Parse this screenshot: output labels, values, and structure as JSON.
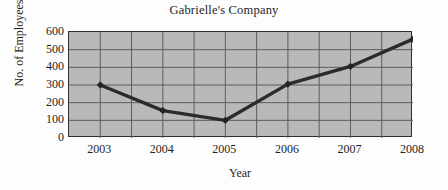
{
  "chart_data": {
    "type": "line",
    "title": "Gabrielle's Company",
    "xlabel": "Year",
    "ylabel": "No. of Employees",
    "categories": [
      "2003",
      "2004",
      "2005",
      "2006",
      "2007",
      "2008"
    ],
    "x": [
      2003,
      2004,
      2005,
      2006,
      2007,
      2008
    ],
    "values": [
      300,
      155,
      100,
      305,
      405,
      560
    ],
    "series": [
      {
        "name": "No. of Employees",
        "values": [
          300,
          155,
          100,
          305,
          405,
          560
        ]
      }
    ],
    "ylim": [
      0,
      600
    ],
    "ytick_labels": [
      "0",
      "100",
      "200",
      "300",
      "400",
      "500",
      "600"
    ],
    "yticks": [
      0,
      100,
      200,
      300,
      400,
      500,
      600
    ],
    "xtick_labels": [
      "2003",
      "2004",
      "2005",
      "2006",
      "2007",
      "2008"
    ],
    "grid": true,
    "grid_vertical_count": 11,
    "legend": "none",
    "marker": "diamond",
    "colors": {
      "plot_background": "#b9b9b9",
      "line": "#2b2b2b",
      "marker": "#232323",
      "gridline": "#5d5d5d",
      "axis": "#2e2e2e",
      "page_background": "#fdfdfd",
      "text": "#1f1f1f"
    }
  }
}
